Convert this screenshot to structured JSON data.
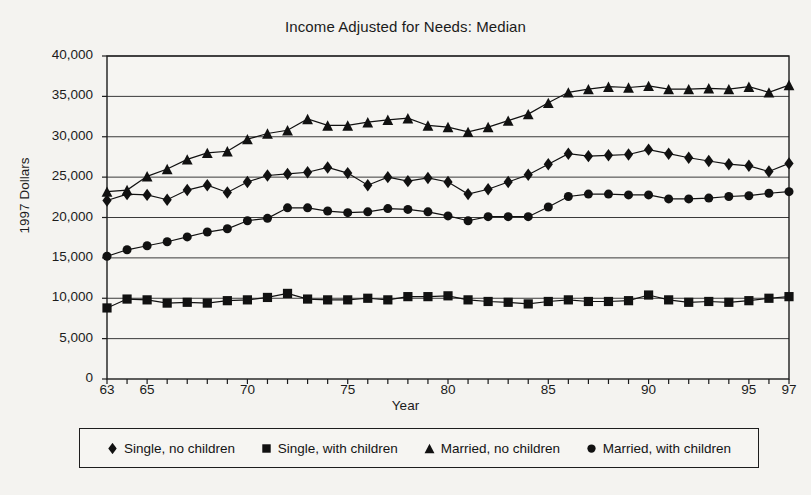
{
  "chart_data": {
    "type": "line",
    "title": "Income Adjusted for Needs: Median",
    "xlabel": "Year",
    "ylabel": "1997 Dollars",
    "grid": true,
    "legend_position": "bottom",
    "xlim": [
      63,
      97
    ],
    "ylim": [
      0,
      40000
    ],
    "ytick_labels": [
      "0",
      "5,000",
      "10,000",
      "15,000",
      "20,000",
      "25,000",
      "30,000",
      "35,000",
      "40,000"
    ],
    "ytick_values": [
      0,
      5000,
      10000,
      15000,
      20000,
      25000,
      30000,
      35000,
      40000
    ],
    "xtick_labels": [
      "63",
      "65",
      "70",
      "75",
      "80",
      "85",
      "90",
      "95",
      "97"
    ],
    "xtick_values": [
      63,
      65,
      70,
      75,
      80,
      85,
      90,
      95,
      97
    ],
    "x": [
      63,
      64,
      65,
      66,
      67,
      68,
      69,
      70,
      71,
      72,
      73,
      74,
      75,
      76,
      77,
      78,
      79,
      80,
      81,
      82,
      83,
      84,
      85,
      86,
      87,
      88,
      89,
      90,
      91,
      92,
      93,
      94,
      95,
      96,
      97
    ],
    "series": [
      {
        "name": "Single, no children",
        "marker": "diamond",
        "color": "#111111",
        "values": [
          22100,
          22900,
          22800,
          22200,
          23400,
          24000,
          23100,
          24400,
          25200,
          25400,
          25600,
          26200,
          25500,
          24000,
          25000,
          24500,
          24900,
          24400,
          22900,
          23500,
          24400,
          25300,
          26600,
          27900,
          27600,
          27700,
          27800,
          28400,
          27900,
          27400,
          27000,
          26600,
          26400,
          25700,
          26700
        ]
      },
      {
        "name": "Single, with children",
        "marker": "square",
        "color": "#111111",
        "values": [
          8800,
          9900,
          9800,
          9400,
          9500,
          9400,
          9700,
          9800,
          10100,
          10600,
          9900,
          9800,
          9800,
          10000,
          9800,
          10200,
          10200,
          10300,
          9800,
          9600,
          9500,
          9300,
          9600,
          9800,
          9600,
          9600,
          9700,
          10400,
          9800,
          9500,
          9600,
          9500,
          9700,
          10000,
          10200
        ]
      },
      {
        "name": "Married, no children",
        "marker": "triangle",
        "color": "#111111",
        "values": [
          23200,
          23400,
          25100,
          26000,
          27200,
          28000,
          28200,
          29700,
          30400,
          30800,
          32200,
          31400,
          31400,
          31800,
          32100,
          32300,
          31400,
          31200,
          30600,
          31200,
          32000,
          32800,
          34200,
          35500,
          35900,
          36200,
          36100,
          36300,
          35900,
          35900,
          36000,
          35900,
          36200,
          35500,
          36400
        ]
      },
      {
        "name": "Married, with children",
        "marker": "circle",
        "color": "#111111",
        "values": [
          15200,
          16000,
          16500,
          17000,
          17600,
          18200,
          18600,
          19600,
          19900,
          21200,
          21200,
          20800,
          20600,
          20700,
          21100,
          21000,
          20700,
          20200,
          19600,
          20100,
          20100,
          20100,
          21300,
          22600,
          22900,
          22900,
          22800,
          22800,
          22300,
          22300,
          22400,
          22600,
          22700,
          23000,
          23200
        ]
      }
    ]
  },
  "legend": {
    "items": [
      {
        "label": "Single, no children",
        "marker": "diamond"
      },
      {
        "label": "Single, with children",
        "marker": "square"
      },
      {
        "label": "Married, no children",
        "marker": "triangle"
      },
      {
        "label": "Married, with children",
        "marker": "circle"
      }
    ]
  }
}
